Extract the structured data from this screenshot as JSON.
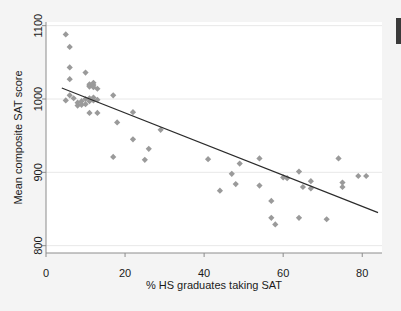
{
  "figure": {
    "background_color": "#f4f4f4",
    "plot_background_color": "#ffffff",
    "marker_color": "#9a9a9a",
    "line_color": "#2b2b2b",
    "grid_color": "#e8e8e8",
    "axis_color": "#8c8c8c",
    "text_color": "#1a1a1a"
  },
  "chart_data": {
    "type": "scatter",
    "title": "",
    "subtitle": "",
    "xlabel": "% HS graduates taking SAT",
    "ylabel": "Mean composite SAT score",
    "xlim": [
      0,
      85
    ],
    "ylim": [
      790,
      1105
    ],
    "xticks": [
      0,
      20,
      40,
      60,
      80
    ],
    "xtick_labels": [
      "0",
      "20",
      "40",
      "60",
      "80"
    ],
    "yticks": [
      800,
      900,
      1000,
      1100
    ],
    "ytick_labels": [
      "800",
      "900",
      "1000",
      "1100"
    ],
    "grid": "horizontal",
    "legend": "none",
    "marker_shape": "diamond",
    "points": [
      {
        "x": 5,
        "y": 1088
      },
      {
        "x": 5,
        "y": 998
      },
      {
        "x": 6,
        "y": 1071
      },
      {
        "x": 6,
        "y": 1043
      },
      {
        "x": 6,
        "y": 1027
      },
      {
        "x": 6,
        "y": 1005
      },
      {
        "x": 7,
        "y": 1001
      },
      {
        "x": 8,
        "y": 995
      },
      {
        "x": 8,
        "y": 991
      },
      {
        "x": 9,
        "y": 992
      },
      {
        "x": 9,
        "y": 997
      },
      {
        "x": 10,
        "y": 1036
      },
      {
        "x": 10,
        "y": 1000
      },
      {
        "x": 10,
        "y": 993
      },
      {
        "x": 11,
        "y": 1020
      },
      {
        "x": 11,
        "y": 1018
      },
      {
        "x": 11,
        "y": 1017
      },
      {
        "x": 11,
        "y": 1001
      },
      {
        "x": 11,
        "y": 997
      },
      {
        "x": 11,
        "y": 981
      },
      {
        "x": 12,
        "y": 1022
      },
      {
        "x": 12,
        "y": 1019
      },
      {
        "x": 12,
        "y": 1016
      },
      {
        "x": 12,
        "y": 1002
      },
      {
        "x": 12,
        "y": 998
      },
      {
        "x": 13,
        "y": 1014
      },
      {
        "x": 13,
        "y": 999
      },
      {
        "x": 13,
        "y": 981
      },
      {
        "x": 17,
        "y": 1005
      },
      {
        "x": 17,
        "y": 921
      },
      {
        "x": 18,
        "y": 968
      },
      {
        "x": 22,
        "y": 982
      },
      {
        "x": 22,
        "y": 945
      },
      {
        "x": 25,
        "y": 917
      },
      {
        "x": 26,
        "y": 932
      },
      {
        "x": 29,
        "y": 958
      },
      {
        "x": 41,
        "y": 918
      },
      {
        "x": 44,
        "y": 875
      },
      {
        "x": 47,
        "y": 898
      },
      {
        "x": 48,
        "y": 884
      },
      {
        "x": 49,
        "y": 912
      },
      {
        "x": 54,
        "y": 919
      },
      {
        "x": 54,
        "y": 882
      },
      {
        "x": 57,
        "y": 861
      },
      {
        "x": 57,
        "y": 838
      },
      {
        "x": 58,
        "y": 829
      },
      {
        "x": 60,
        "y": 893
      },
      {
        "x": 61,
        "y": 892
      },
      {
        "x": 64,
        "y": 901
      },
      {
        "x": 64,
        "y": 838
      },
      {
        "x": 65,
        "y": 880
      },
      {
        "x": 67,
        "y": 878
      },
      {
        "x": 67,
        "y": 888
      },
      {
        "x": 71,
        "y": 836
      },
      {
        "x": 74,
        "y": 919
      },
      {
        "x": 75,
        "y": 886
      },
      {
        "x": 75,
        "y": 880
      },
      {
        "x": 79,
        "y": 895
      },
      {
        "x": 81,
        "y": 895
      }
    ],
    "fit_line": {
      "label": "linear fit",
      "x_start": 4,
      "y_start": 1015,
      "x_end": 84,
      "y_end": 845
    }
  }
}
